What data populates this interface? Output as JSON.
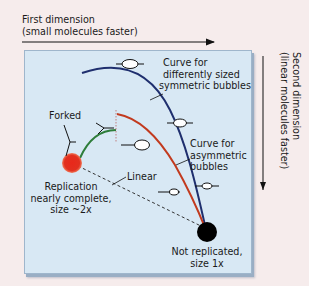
{
  "axes": {
    "first_dimension": {
      "line1": "First dimension",
      "line2": "(small molecules faster)",
      "direction": "right"
    },
    "second_dimension": {
      "line1": "Second dimension",
      "line2": "(linear molecules faster)",
      "direction": "down"
    }
  },
  "labels": {
    "symmetric_curve": {
      "line1": "Curve for",
      "line2": "differently sized",
      "line3": "symmetric bubbles"
    },
    "asymmetric_curve": {
      "line1": "Curve for",
      "line2": "asymmetric",
      "line3": "bubbles"
    },
    "forked": "Forked",
    "linear": "Linear",
    "replicated_spot": {
      "line1": "Replication",
      "line2": "nearly complete,",
      "line3": "size ~2x"
    },
    "unreplicated_spot": {
      "line1": "Not replicated,",
      "line2": "size 1x"
    }
  },
  "colors": {
    "panel_bg": "#d8e8f4",
    "page_bg": "#f6ecec",
    "symmetric_curve": "#1f2f6e",
    "asymmetric_curve": "#c23a1e",
    "forked_curve": "#2e7d3a",
    "replicated_spot": "#e0281c",
    "unreplicated_spot": "#000000",
    "linear_line": "#333333"
  }
}
